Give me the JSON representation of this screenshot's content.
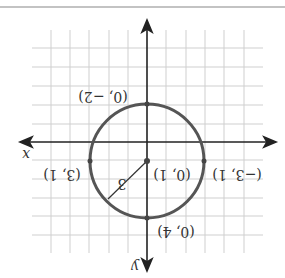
{
  "diagram": {
    "rotation_deg": 180,
    "axes": {
      "x_label": "x",
      "y_label": "y"
    },
    "circle": {
      "center": [
        0,
        1
      ],
      "radius": 3,
      "radius_label": "3"
    },
    "points": [
      {
        "label": "(0, 1)",
        "coords": [
          0,
          1
        ],
        "role": "center"
      },
      {
        "label": "(0, −2)",
        "coords": [
          0,
          -2
        ]
      },
      {
        "label": "(0, 4)",
        "coords": [
          0,
          4
        ]
      },
      {
        "label": "(3, 1)",
        "coords": [
          3,
          1
        ]
      },
      {
        "label": "(−3, 1)",
        "coords": [
          -3,
          1
        ]
      }
    ],
    "colors": {
      "circle": "#555555",
      "grid": "#cccccc",
      "axis": "#222222",
      "top_rule": "#888888"
    }
  }
}
